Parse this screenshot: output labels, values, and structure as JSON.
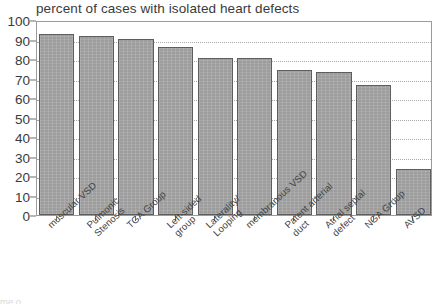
{
  "chart_data": {
    "type": "bar",
    "title": "percent of cases with isolated heart defects",
    "xlabel": "",
    "ylabel": "",
    "ylim": [
      0,
      100
    ],
    "ytick_step": 10,
    "yticks": [
      100,
      90,
      80,
      70,
      60,
      50,
      40,
      30,
      20,
      10,
      0
    ],
    "grid": "horizontal-dotted",
    "legend": "none",
    "bar_color": "#9d9d9d",
    "bar_edge_color": "#5d5d5d",
    "categories": [
      "muscular VSD",
      "Pulmonic Stenosis",
      "TGA Group",
      "Left-sided group",
      "Laterality/ Looping",
      "membranous VSD",
      "Patent arterial duct",
      "Atrial septal defect",
      "NGA Group",
      "AVSD"
    ],
    "category_lines": [
      [
        "muscular VSD"
      ],
      [
        "Pulmonic",
        "Stenosis"
      ],
      [
        "TGA Group"
      ],
      [
        "Left-sided",
        "group"
      ],
      [
        "Laterality/",
        "Looping"
      ],
      [
        "membranous VSD"
      ],
      [
        "Patent arterial",
        "duct"
      ],
      [
        "Atrial septal",
        "defect"
      ],
      [
        "NGA Group"
      ],
      [
        "AVSD"
      ]
    ],
    "values": [
      93,
      92,
      90.5,
      86,
      80.5,
      80.5,
      74.5,
      73.5,
      66.5,
      23.5
    ]
  },
  "bottom_ghost": {
    "text": "me                    o"
  }
}
